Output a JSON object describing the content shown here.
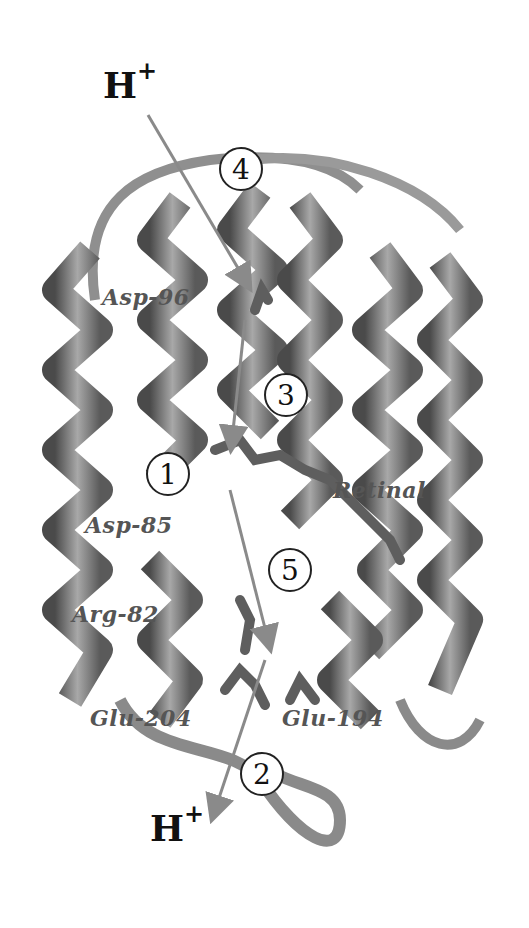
{
  "figure": {
    "protons": [
      {
        "id": "top",
        "label": "H",
        "charge": "+"
      },
      {
        "id": "bottom",
        "label": "H",
        "charge": "+"
      }
    ],
    "steps": [
      {
        "n": "1"
      },
      {
        "n": "2"
      },
      {
        "n": "3"
      },
      {
        "n": "4"
      },
      {
        "n": "5"
      }
    ],
    "residues": {
      "asp96": "Asp-96",
      "retinal": "Retinal",
      "asp85": "Asp-85",
      "arg82": "Arg-82",
      "glu204": "Glu-204",
      "glu194": "Glu-194"
    },
    "colors": {
      "ribbon": "#8a8a8a",
      "ribbon_dark": "#4a4a4a",
      "ribbon_light": "#c8c8c8",
      "arrow": "#8a8a8a",
      "label": "#555555",
      "background": "#ffffff"
    }
  }
}
